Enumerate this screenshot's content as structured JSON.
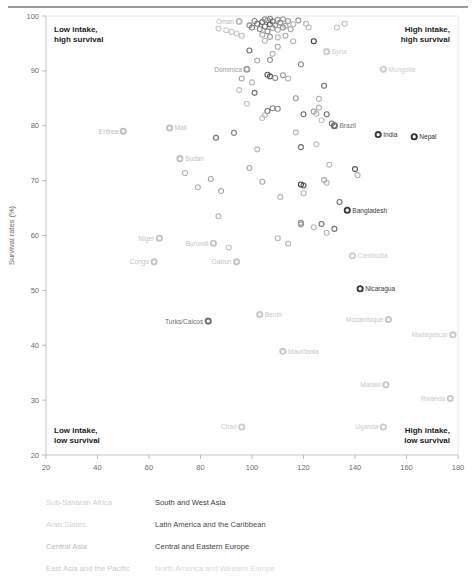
{
  "chart_data": {
    "type": "scatter",
    "title": "",
    "xlabel": "Gross intake rates (%)",
    "ylabel": "Survival rates (%)",
    "xlim": [
      20,
      180
    ],
    "ylim": [
      20,
      100
    ],
    "xticks": [
      20,
      40,
      60,
      80,
      100,
      120,
      140,
      160,
      180
    ],
    "yticks": [
      20,
      30,
      40,
      50,
      60,
      70,
      80,
      90,
      100
    ],
    "grid": false,
    "legend_position": "below-plot",
    "annotations": [
      {
        "text": "Low intake,\nhigh survival",
        "corner": "top-left"
      },
      {
        "text": "High intake,\nhigh survival",
        "corner": "top-right"
      },
      {
        "text": "Low intake,\nlow survival",
        "corner": "bottom-left"
      },
      {
        "text": "High intake,\nlow survival",
        "corner": "bottom-right"
      }
    ],
    "series": [
      {
        "name": "Sub-Saharan Africa",
        "color": "#d8d8d8"
      },
      {
        "name": "Arab States",
        "color": "#c9c9c9"
      },
      {
        "name": "Central Asia",
        "color": "#a8a8a8"
      },
      {
        "name": "East Asia and the Pacific",
        "color": "#dcdcdc"
      },
      {
        "name": "South and West Asia",
        "color": "#3a3a3a"
      },
      {
        "name": "Latin America and the Caribbean",
        "color": "#7a7a7a"
      },
      {
        "name": "Central and Eastern Europe",
        "color": "#555555"
      },
      {
        "name": "North America and Western Europe",
        "color": "#e2e2e2"
      }
    ],
    "labeled_points": [
      {
        "label": "Oman",
        "x": 95,
        "y": 99.0,
        "color": "#bdbdbd",
        "anchor": "end"
      },
      {
        "label": "Syria",
        "x": 129,
        "y": 93.5,
        "color": "#cccccc",
        "anchor": "start"
      },
      {
        "label": "Mongolia",
        "x": 151,
        "y": 90.3,
        "color": "#cfcfcf",
        "anchor": "start"
      },
      {
        "label": "Dominica",
        "x": 98,
        "y": 90.3,
        "color": "#a0a0a0",
        "anchor": "end"
      },
      {
        "label": "Eritrea",
        "x": 50,
        "y": 79.0,
        "color": "#bdbdbd",
        "anchor": "end"
      },
      {
        "label": "Mali",
        "x": 68,
        "y": 79.6,
        "color": "#c2c2c2",
        "anchor": "start"
      },
      {
        "label": "Brazil",
        "x": 132,
        "y": 80.0,
        "color": "#6f6f6f",
        "anchor": "start"
      },
      {
        "label": "India",
        "x": 149,
        "y": 78.4,
        "color": "#3a3a3a",
        "anchor": "start"
      },
      {
        "label": "Nepal",
        "x": 163,
        "y": 78.0,
        "color": "#2f2f2f",
        "anchor": "start"
      },
      {
        "label": "Sudan",
        "x": 72,
        "y": 74.0,
        "color": "#c2c2c2",
        "anchor": "start"
      },
      {
        "label": "Bangladesh",
        "x": 137,
        "y": 64.6,
        "color": "#3a3a3a",
        "anchor": "start"
      },
      {
        "label": "Niger",
        "x": 64,
        "y": 59.5,
        "color": "#c5c5c5",
        "anchor": "end"
      },
      {
        "label": "Burundi",
        "x": 85,
        "y": 58.6,
        "color": "#c5c5c5",
        "anchor": "end"
      },
      {
        "label": "Congo",
        "x": 62,
        "y": 55.2,
        "color": "#c5c5c5",
        "anchor": "end"
      },
      {
        "label": "Gabon",
        "x": 94,
        "y": 55.2,
        "color": "#c5c5c5",
        "anchor": "end"
      },
      {
        "label": "Cambodia",
        "x": 139,
        "y": 56.3,
        "color": "#cfcfcf",
        "anchor": "start"
      },
      {
        "label": "Nicaragua",
        "x": 142,
        "y": 50.3,
        "color": "#3a3a3a",
        "anchor": "start"
      },
      {
        "label": "Turks/Caicos",
        "x": 83,
        "y": 44.4,
        "color": "#6f6f6f",
        "anchor": "end"
      },
      {
        "label": "Benin",
        "x": 103,
        "y": 45.6,
        "color": "#c5c5c5",
        "anchor": "start"
      },
      {
        "label": "Mozambique",
        "x": 153,
        "y": 44.7,
        "color": "#c9c9c9",
        "anchor": "end"
      },
      {
        "label": "Madagascar",
        "x": 178,
        "y": 41.9,
        "color": "#cccccc",
        "anchor": "end"
      },
      {
        "label": "Mauritania",
        "x": 112,
        "y": 38.9,
        "color": "#c9c9c9",
        "anchor": "start"
      },
      {
        "label": "Malawi",
        "x": 152,
        "y": 32.8,
        "color": "#c9c9c9",
        "anchor": "end"
      },
      {
        "label": "Rwanda",
        "x": 177,
        "y": 30.3,
        "color": "#c9c9c9",
        "anchor": "end"
      },
      {
        "label": "Chad",
        "x": 96,
        "y": 25.1,
        "color": "#cccccc",
        "anchor": "end"
      },
      {
        "label": "Uganda",
        "x": 151,
        "y": 25.1,
        "color": "#cccccc",
        "anchor": "end"
      }
    ],
    "unlabeled_points": [
      {
        "x": 87,
        "y": 97.7,
        "color": "#c9c9c9"
      },
      {
        "x": 90,
        "y": 97.4,
        "color": "#c9c9c9"
      },
      {
        "x": 92,
        "y": 97.1,
        "color": "#c9c9c9"
      },
      {
        "x": 94,
        "y": 96.8,
        "color": "#c9c9c9"
      },
      {
        "x": 96,
        "y": 96.4,
        "color": "#bdbdbd"
      },
      {
        "x": 99,
        "y": 98.3,
        "color": "#8a8a8a"
      },
      {
        "x": 100,
        "y": 97.9,
        "color": "#7a7a7a"
      },
      {
        "x": 101,
        "y": 99.1,
        "color": "#8a8a8a"
      },
      {
        "x": 102,
        "y": 98.6,
        "color": "#6f6f6f"
      },
      {
        "x": 103,
        "y": 97.6,
        "color": "#8a8a8a"
      },
      {
        "x": 104,
        "y": 98.9,
        "color": "#555555"
      },
      {
        "x": 105,
        "y": 99.4,
        "color": "#8a8a8a"
      },
      {
        "x": 105,
        "y": 98.1,
        "color": "#6f6f6f"
      },
      {
        "x": 106,
        "y": 99.2,
        "color": "#9a9a9a"
      },
      {
        "x": 106,
        "y": 97.2,
        "color": "#8a8a8a"
      },
      {
        "x": 107,
        "y": 98.5,
        "color": "#555555"
      },
      {
        "x": 107,
        "y": 99.5,
        "color": "#8a8a8a"
      },
      {
        "x": 108,
        "y": 97.8,
        "color": "#9a9a9a"
      },
      {
        "x": 108,
        "y": 99.0,
        "color": "#6f6f6f"
      },
      {
        "x": 109,
        "y": 98.3,
        "color": "#8a8a8a"
      },
      {
        "x": 110,
        "y": 99.3,
        "color": "#9a9a9a"
      },
      {
        "x": 110,
        "y": 97.5,
        "color": "#a8a8a8"
      },
      {
        "x": 111,
        "y": 98.8,
        "color": "#8a8a8a"
      },
      {
        "x": 112,
        "y": 99.4,
        "color": "#9a9a9a"
      },
      {
        "x": 112,
        "y": 97.9,
        "color": "#8a8a8a"
      },
      {
        "x": 113,
        "y": 98.2,
        "color": "#a8a8a8"
      },
      {
        "x": 114,
        "y": 99.1,
        "color": "#9a9a9a"
      },
      {
        "x": 115,
        "y": 97.6,
        "color": "#a8a8a8"
      },
      {
        "x": 116,
        "y": 98.5,
        "color": "#b5b5b5"
      },
      {
        "x": 118,
        "y": 99.2,
        "color": "#9a9a9a"
      },
      {
        "x": 104,
        "y": 96.6,
        "color": "#a8a8a8"
      },
      {
        "x": 107,
        "y": 96.2,
        "color": "#9a9a9a"
      },
      {
        "x": 110,
        "y": 96.1,
        "color": "#b5b5b5"
      },
      {
        "x": 113,
        "y": 96.4,
        "color": "#a8a8a8"
      },
      {
        "x": 116,
        "y": 95.4,
        "color": "#b5b5b5"
      },
      {
        "x": 121,
        "y": 98.6,
        "color": "#b5b5b5"
      },
      {
        "x": 122,
        "y": 97.9,
        "color": "#b5b5b5"
      },
      {
        "x": 133,
        "y": 97.9,
        "color": "#c2c2c2"
      },
      {
        "x": 136,
        "y": 98.6,
        "color": "#c2c2c2"
      },
      {
        "x": 124,
        "y": 95.4,
        "color": "#3a3a3a"
      },
      {
        "x": 110,
        "y": 94.4,
        "color": "#a8a8a8"
      },
      {
        "x": 99,
        "y": 93.7,
        "color": "#6f6f6f"
      },
      {
        "x": 102,
        "y": 91.9,
        "color": "#a8a8a8"
      },
      {
        "x": 108,
        "y": 93.1,
        "color": "#b5b5b5"
      },
      {
        "x": 107,
        "y": 92.0,
        "color": "#9a9a9a"
      },
      {
        "x": 119,
        "y": 91.2,
        "color": "#8a8a8a"
      },
      {
        "x": 96,
        "y": 88.6,
        "color": "#a8a8a8"
      },
      {
        "x": 100,
        "y": 87.9,
        "color": "#b5b5b5"
      },
      {
        "x": 95,
        "y": 86.5,
        "color": "#c2c2c2"
      },
      {
        "x": 101,
        "y": 86.0,
        "color": "#6f6f6f"
      },
      {
        "x": 106,
        "y": 89.3,
        "color": "#555555"
      },
      {
        "x": 107,
        "y": 89.0,
        "color": "#555555"
      },
      {
        "x": 109,
        "y": 88.7,
        "color": "#8a8a8a"
      },
      {
        "x": 112,
        "y": 89.2,
        "color": "#9a9a9a"
      },
      {
        "x": 114,
        "y": 88.6,
        "color": "#b5b5b5"
      },
      {
        "x": 128,
        "y": 87.3,
        "color": "#6f6f6f"
      },
      {
        "x": 117,
        "y": 85.0,
        "color": "#9a9a9a"
      },
      {
        "x": 126,
        "y": 84.9,
        "color": "#b5b5b5"
      },
      {
        "x": 108,
        "y": 83.2,
        "color": "#8a8a8a"
      },
      {
        "x": 110,
        "y": 83.1,
        "color": "#8a8a8a"
      },
      {
        "x": 106,
        "y": 82.7,
        "color": "#6f6f6f"
      },
      {
        "x": 105,
        "y": 81.9,
        "color": "#b5b5b5"
      },
      {
        "x": 104,
        "y": 81.4,
        "color": "#c2c2c2"
      },
      {
        "x": 120,
        "y": 82.1,
        "color": "#6f6f6f"
      },
      {
        "x": 124,
        "y": 82.6,
        "color": "#9a9a9a"
      },
      {
        "x": 125,
        "y": 82.2,
        "color": "#b5b5b5"
      },
      {
        "x": 126,
        "y": 83.3,
        "color": "#b5b5b5"
      },
      {
        "x": 127,
        "y": 81.0,
        "color": "#c2c2c2"
      },
      {
        "x": 129,
        "y": 82.1,
        "color": "#6f6f6f"
      },
      {
        "x": 131,
        "y": 80.4,
        "color": "#6f6f6f"
      },
      {
        "x": 93,
        "y": 78.7,
        "color": "#8a8a8a"
      },
      {
        "x": 86,
        "y": 77.8,
        "color": "#6f6f6f"
      },
      {
        "x": 117,
        "y": 78.8,
        "color": "#b5b5b5"
      },
      {
        "x": 119,
        "y": 76.1,
        "color": "#6f6f6f"
      },
      {
        "x": 125,
        "y": 76.6,
        "color": "#c2c2c2"
      },
      {
        "x": 102,
        "y": 75.7,
        "color": "#b5b5b5"
      },
      {
        "x": 99,
        "y": 72.3,
        "color": "#a8a8a8"
      },
      {
        "x": 74,
        "y": 71.4,
        "color": "#b5b5b5"
      },
      {
        "x": 79,
        "y": 68.8,
        "color": "#b5b5b5"
      },
      {
        "x": 84,
        "y": 70.3,
        "color": "#a8a8a8"
      },
      {
        "x": 88,
        "y": 68.1,
        "color": "#a8a8a8"
      },
      {
        "x": 87,
        "y": 63.5,
        "color": "#b5b5b5"
      },
      {
        "x": 104,
        "y": 69.8,
        "color": "#a8a8a8"
      },
      {
        "x": 111,
        "y": 67.0,
        "color": "#b5b5b5"
      },
      {
        "x": 119,
        "y": 69.3,
        "color": "#3a3a3a"
      },
      {
        "x": 120,
        "y": 69.1,
        "color": "#555555"
      },
      {
        "x": 120,
        "y": 67.7,
        "color": "#b5b5b5"
      },
      {
        "x": 128,
        "y": 70.1,
        "color": "#a8a8a8"
      },
      {
        "x": 129,
        "y": 69.6,
        "color": "#b5b5b5"
      },
      {
        "x": 130,
        "y": 72.9,
        "color": "#b5b5b5"
      },
      {
        "x": 140,
        "y": 72.1,
        "color": "#555555"
      },
      {
        "x": 141,
        "y": 71.0,
        "color": "#b5b5b5"
      },
      {
        "x": 134,
        "y": 66.1,
        "color": "#6f6f6f"
      },
      {
        "x": 119,
        "y": 62.3,
        "color": "#8a8a8a"
      },
      {
        "x": 119,
        "y": 62.0,
        "color": "#9a9a9a"
      },
      {
        "x": 124,
        "y": 61.5,
        "color": "#b5b5b5"
      },
      {
        "x": 127,
        "y": 62.1,
        "color": "#6f6f6f"
      },
      {
        "x": 129,
        "y": 60.5,
        "color": "#b5b5b5"
      },
      {
        "x": 132,
        "y": 61.2,
        "color": "#6f6f6f"
      },
      {
        "x": 110,
        "y": 59.5,
        "color": "#b5b5b5"
      },
      {
        "x": 114,
        "y": 58.5,
        "color": "#b5b5b5"
      },
      {
        "x": 91,
        "y": 57.8,
        "color": "#c2c2c2"
      },
      {
        "x": 105,
        "y": 95.5,
        "color": "#b5b5b5"
      },
      {
        "x": 98,
        "y": 84.0,
        "color": "#c2c2c2"
      }
    ]
  },
  "legend": {
    "left_column": [
      {
        "label": "Sub-Saharan Africa",
        "color": "#cfcfcf"
      },
      {
        "label": "Arab States",
        "color": "#d4d4d4"
      },
      {
        "label": "Central Asia",
        "color": "#bdbdbd"
      },
      {
        "label": "East Asia and the Pacific",
        "color": "#cccccc"
      }
    ],
    "right_column": [
      {
        "label": "South and West Asia",
        "color": "#3a3a3a"
      },
      {
        "label": "Latin America and the Caribbean",
        "color": "#4a4a4a"
      },
      {
        "label": "Central and Eastern Europe",
        "color": "#3f3f3f"
      },
      {
        "label": "North America and Western Europe",
        "color": "#d8d8d8"
      }
    ]
  }
}
